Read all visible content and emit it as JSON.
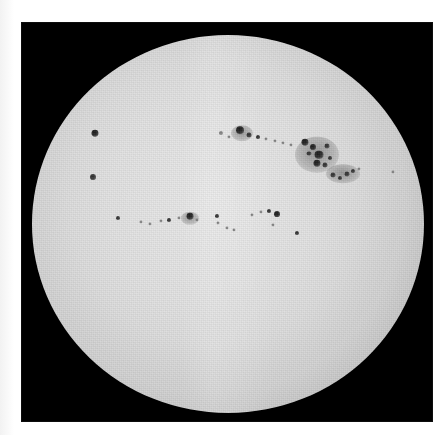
{
  "figure": {
    "title": "White-light photograph of the solar disk with sunspots",
    "plate_background_color": "#000000",
    "paper_background_color": "#ffffff",
    "disk_center_color": "#e8e8e8",
    "disk_limb_color": "#6d6d6d",
    "spot_umbra_color": "#2e2e2e"
  },
  "chart_data": {
    "type": "scatter",
    "xlabel": "",
    "ylabel": "",
    "grid": false,
    "legend": "none",
    "xlim": [
      0,
      412
    ],
    "ylim": [
      0,
      400
    ],
    "disk": {
      "cx": 207,
      "cy": 202,
      "r": 196
    },
    "series": [
      {
        "name": "sunspots",
        "points": [
          {
            "id": "A1",
            "x": 74,
            "y": 108,
            "size": 7,
            "class": "dark"
          },
          {
            "id": "A2",
            "x": 72,
            "y": 153,
            "size": 6,
            "class": "spot"
          },
          {
            "id": "B1",
            "x": 200,
            "y": 108,
            "size": 4,
            "class": "faint"
          },
          {
            "id": "B2",
            "x": 208,
            "y": 112,
            "size": 3,
            "class": "faint"
          },
          {
            "id": "B3",
            "x": 219,
            "y": 105,
            "size": 8,
            "class": "dark"
          },
          {
            "id": "B4",
            "x": 228,
            "y": 110,
            "size": 5,
            "class": "spot"
          },
          {
            "id": "B5",
            "x": 237,
            "y": 112,
            "size": 4,
            "class": "spot"
          },
          {
            "id": "B6",
            "x": 245,
            "y": 114,
            "size": 3,
            "class": "faint"
          },
          {
            "id": "B7",
            "x": 254,
            "y": 116,
            "size": 3,
            "class": "faint"
          },
          {
            "id": "B8",
            "x": 262,
            "y": 118,
            "size": 3,
            "class": "faint"
          },
          {
            "id": "B9",
            "x": 270,
            "y": 120,
            "size": 3,
            "class": "faint"
          },
          {
            "id": "C1",
            "x": 284,
            "y": 117,
            "size": 7,
            "class": "dark"
          },
          {
            "id": "C2",
            "x": 292,
            "y": 122,
            "size": 6,
            "class": "dark"
          },
          {
            "id": "C3",
            "x": 288,
            "y": 129,
            "size": 5,
            "class": "spot"
          },
          {
            "id": "C4",
            "x": 298,
            "y": 130,
            "size": 9,
            "class": "dark"
          },
          {
            "id": "C5",
            "x": 306,
            "y": 121,
            "size": 5,
            "class": "spot"
          },
          {
            "id": "C6",
            "x": 296,
            "y": 139,
            "size": 7,
            "class": "dark"
          },
          {
            "id": "C7",
            "x": 304,
            "y": 141,
            "size": 5,
            "class": "spot"
          },
          {
            "id": "C8",
            "x": 309,
            "y": 134,
            "size": 4,
            "class": "spot"
          },
          {
            "id": "D1",
            "x": 312,
            "y": 151,
            "size": 5,
            "class": "spot"
          },
          {
            "id": "D2",
            "x": 319,
            "y": 154,
            "size": 4,
            "class": "spot"
          },
          {
            "id": "D3",
            "x": 326,
            "y": 150,
            "size": 5,
            "class": "spot"
          },
          {
            "id": "D4",
            "x": 332,
            "y": 147,
            "size": 4,
            "class": "spot"
          },
          {
            "id": "D5",
            "x": 338,
            "y": 145,
            "size": 3,
            "class": "faint"
          },
          {
            "id": "E1",
            "x": 372,
            "y": 148,
            "size": 3,
            "class": "faint"
          },
          {
            "id": "F1",
            "x": 120,
            "y": 200,
            "size": 3,
            "class": "faint"
          },
          {
            "id": "F2",
            "x": 129,
            "y": 202,
            "size": 3,
            "class": "faint"
          },
          {
            "id": "F3",
            "x": 140,
            "y": 199,
            "size": 3,
            "class": "faint"
          },
          {
            "id": "F4",
            "x": 148,
            "y": 198,
            "size": 4,
            "class": "spot"
          },
          {
            "id": "F5",
            "x": 158,
            "y": 196,
            "size": 3,
            "class": "faint"
          },
          {
            "id": "F6",
            "x": 169,
            "y": 194,
            "size": 7,
            "class": "dark"
          },
          {
            "id": "F7",
            "x": 176,
            "y": 198,
            "size": 3,
            "class": "faint"
          },
          {
            "id": "G1",
            "x": 196,
            "y": 194,
            "size": 4,
            "class": "spot"
          },
          {
            "id": "G2",
            "x": 197,
            "y": 201,
            "size": 3,
            "class": "faint"
          },
          {
            "id": "G3",
            "x": 206,
            "y": 206,
            "size": 3,
            "class": "faint"
          },
          {
            "id": "G4",
            "x": 213,
            "y": 208,
            "size": 3,
            "class": "faint"
          },
          {
            "id": "H1",
            "x": 231,
            "y": 193,
            "size": 3,
            "class": "faint"
          },
          {
            "id": "H2",
            "x": 240,
            "y": 190,
            "size": 3,
            "class": "faint"
          },
          {
            "id": "H3",
            "x": 248,
            "y": 189,
            "size": 4,
            "class": "spot"
          },
          {
            "id": "H4",
            "x": 256,
            "y": 192,
            "size": 6,
            "class": "dark"
          },
          {
            "id": "H5",
            "x": 252,
            "y": 203,
            "size": 3,
            "class": "faint"
          },
          {
            "id": "I1",
            "x": 276,
            "y": 211,
            "size": 4,
            "class": "spot"
          },
          {
            "id": "J1",
            "x": 97,
            "y": 196,
            "size": 4,
            "class": "spot"
          }
        ],
        "penumbrae": [
          {
            "id": "P1",
            "x": 296,
            "y": 130,
            "w": 44,
            "h": 38
          },
          {
            "id": "P2",
            "x": 322,
            "y": 150,
            "w": 34,
            "h": 20
          },
          {
            "id": "P3",
            "x": 221,
            "y": 108,
            "w": 22,
            "h": 16
          },
          {
            "id": "P4",
            "x": 169,
            "y": 196,
            "w": 18,
            "h": 13
          }
        ]
      }
    ]
  }
}
